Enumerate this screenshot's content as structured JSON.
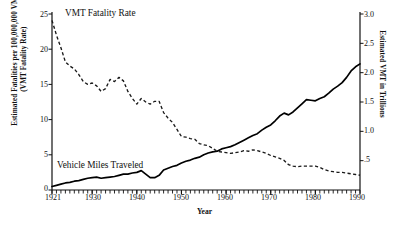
{
  "chart_data": {
    "type": "line",
    "title": "",
    "xlabel": "Year",
    "grid": false,
    "legend_position": "inline-annotations",
    "x_axis": {
      "label": "Year",
      "min": 1921,
      "max": 1990,
      "tick_labels": [
        "1921",
        "1930",
        "1940",
        "1950",
        "1960",
        "1970",
        "1980",
        "1990"
      ],
      "tick_values": [
        1921,
        1930,
        1940,
        1950,
        1960,
        1970,
        1980,
        1990
      ],
      "minor_ticks": "every year"
    },
    "y_axis_left": {
      "label_line1": "Estimated Fatalities per 100,000,000 VMT",
      "label_line2": "(VMT Fatality Rate)",
      "min": 0,
      "max": 25,
      "tick_labels": [
        "0",
        "5",
        "10",
        "15",
        "20",
        "25"
      ],
      "tick_values": [
        0,
        5,
        10,
        15,
        20,
        25
      ]
    },
    "y_axis_right": {
      "label": "Estimated VMT in Trillions",
      "min": 0,
      "max": 3.0,
      "tick_labels": [
        ".5",
        "1.0",
        "1.5",
        "2.0",
        "2.5",
        "3.0"
      ],
      "tick_values": [
        0.5,
        1.0,
        1.5,
        2.0,
        2.5,
        3.0
      ]
    },
    "series": [
      {
        "name": "VMT Fatality Rate",
        "axis": "left",
        "style": "dashed",
        "color": "#1a1a1a",
        "x": [
          1921,
          1922,
          1923,
          1924,
          1925,
          1926,
          1927,
          1928,
          1929,
          1930,
          1931,
          1932,
          1933,
          1934,
          1935,
          1936,
          1937,
          1938,
          1939,
          1940,
          1941,
          1942,
          1943,
          1944,
          1945,
          1946,
          1947,
          1948,
          1949,
          1950,
          1951,
          1952,
          1953,
          1954,
          1955,
          1956,
          1957,
          1958,
          1959,
          1960,
          1961,
          1962,
          1963,
          1964,
          1965,
          1966,
          1967,
          1968,
          1969,
          1970,
          1971,
          1972,
          1973,
          1974,
          1975,
          1976,
          1977,
          1978,
          1979,
          1980,
          1981,
          1982,
          1983,
          1984,
          1985,
          1986,
          1987,
          1988,
          1989,
          1990
        ],
        "values": [
          24.1,
          22.0,
          20.2,
          18.2,
          17.6,
          17.2,
          16.4,
          15.4,
          15.0,
          15.2,
          14.8,
          14.0,
          14.4,
          15.7,
          15.4,
          16.0,
          15.5,
          14.0,
          13.0,
          12.2,
          13.0,
          12.5,
          12.2,
          12.6,
          12.6,
          11.0,
          10.2,
          9.6,
          8.6,
          7.6,
          7.5,
          7.3,
          7.2,
          6.6,
          6.4,
          6.3,
          5.9,
          5.5,
          5.4,
          5.3,
          5.2,
          5.3,
          5.4,
          5.6,
          5.5,
          5.7,
          5.6,
          5.4,
          5.2,
          4.9,
          4.7,
          4.5,
          4.2,
          3.6,
          3.4,
          3.3,
          3.4,
          3.4,
          3.4,
          3.4,
          3.2,
          2.9,
          2.7,
          2.6,
          2.5,
          2.5,
          2.4,
          2.3,
          2.2,
          2.1
        ]
      },
      {
        "name": "Vehicle Miles Traveled",
        "axis": "right",
        "style": "solid",
        "color": "#000000",
        "x": [
          1921,
          1922,
          1923,
          1924,
          1925,
          1926,
          1927,
          1928,
          1929,
          1930,
          1931,
          1932,
          1933,
          1934,
          1935,
          1936,
          1937,
          1938,
          1939,
          1940,
          1941,
          1942,
          1943,
          1944,
          1945,
          1946,
          1947,
          1948,
          1949,
          1950,
          1951,
          1952,
          1953,
          1954,
          1955,
          1956,
          1957,
          1958,
          1959,
          1960,
          1961,
          1962,
          1963,
          1964,
          1965,
          1966,
          1967,
          1968,
          1969,
          1970,
          1971,
          1972,
          1973,
          1974,
          1975,
          1976,
          1977,
          1978,
          1979,
          1980,
          1981,
          1982,
          1983,
          1984,
          1985,
          1986,
          1987,
          1988,
          1989,
          1990
        ],
        "values": [
          0.06,
          0.08,
          0.1,
          0.12,
          0.13,
          0.15,
          0.16,
          0.18,
          0.2,
          0.21,
          0.22,
          0.2,
          0.21,
          0.22,
          0.23,
          0.25,
          0.27,
          0.27,
          0.29,
          0.3,
          0.33,
          0.27,
          0.21,
          0.21,
          0.25,
          0.34,
          0.37,
          0.4,
          0.42,
          0.46,
          0.49,
          0.51,
          0.54,
          0.56,
          0.6,
          0.63,
          0.65,
          0.66,
          0.7,
          0.72,
          0.74,
          0.77,
          0.81,
          0.85,
          0.89,
          0.93,
          0.96,
          1.02,
          1.07,
          1.11,
          1.18,
          1.26,
          1.31,
          1.28,
          1.33,
          1.4,
          1.47,
          1.54,
          1.53,
          1.52,
          1.56,
          1.59,
          1.65,
          1.72,
          1.77,
          1.83,
          1.92,
          2.03,
          2.1,
          2.15
        ]
      }
    ],
    "annotations": [
      {
        "text": "VMT Fatality Rate",
        "x_approx": 1925,
        "y_axis": "left"
      },
      {
        "text": "Vehicle Miles Traveled",
        "x_approx": 1923,
        "y_axis": "right"
      }
    ]
  }
}
